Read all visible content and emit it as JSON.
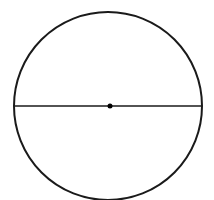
{
  "diagram": {
    "type": "circle-with-diameter",
    "circle": {
      "cx": 108,
      "cy": 106,
      "r": 94,
      "stroke": "#1a1a1a",
      "stroke_width": 2
    },
    "diameter": {
      "x1": 15,
      "y1": 106,
      "x2": 201,
      "y2": 106,
      "stroke": "#1a1a1a",
      "stroke_width": 1.5
    },
    "center_dot": {
      "cx": 110,
      "cy": 106,
      "r": 2.5,
      "fill": "#000000"
    },
    "background": "#ffffff"
  }
}
